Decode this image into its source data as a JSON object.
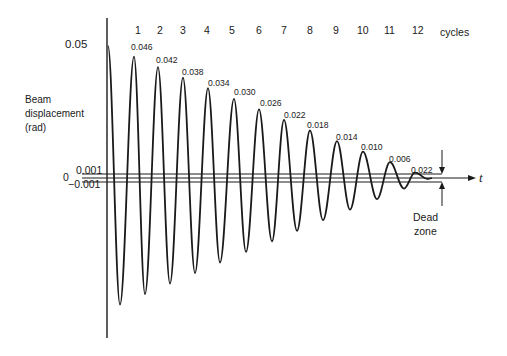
{
  "chart_data": {
    "type": "line",
    "title": "",
    "xlabel": "t",
    "ylabel": "Beam displacement (rad)",
    "top_axis_label": "cycles",
    "cycles": [
      "1",
      "2",
      "3",
      "4",
      "5",
      "6",
      "7",
      "8",
      "9",
      "10",
      "11",
      "12"
    ],
    "y_ticks": [
      "0.05",
      "0.001",
      "0",
      "-0.001"
    ],
    "initial_amplitude": 0.05,
    "peak_labels": [
      "0.046",
      "0.042",
      "0.038",
      "0.034",
      "0.030",
      "0.026",
      "0.022",
      "0.018",
      "0.014",
      "0.010",
      "0.006",
      "0.022"
    ],
    "peak_values": [
      0.046,
      0.042,
      0.038,
      0.034,
      0.03,
      0.026,
      0.022,
      0.018,
      0.014,
      0.01,
      0.006,
      0.002
    ],
    "dead_zone": [
      -0.001,
      0.001
    ],
    "annotations": [
      "Dead zone"
    ],
    "grid": false,
    "legend": null
  },
  "labels": {
    "y_label_line1": "Beam",
    "y_label_line2": "displacement",
    "y_label_line3": "(rad)",
    "y_tick_top": "0.05",
    "y_tick_upper": "0.001",
    "y_tick_zero": "0",
    "y_tick_lower": "−0.001",
    "x_axis": "t",
    "cycles_word": "cycles",
    "dead": "Dead",
    "zone": "zone"
  }
}
